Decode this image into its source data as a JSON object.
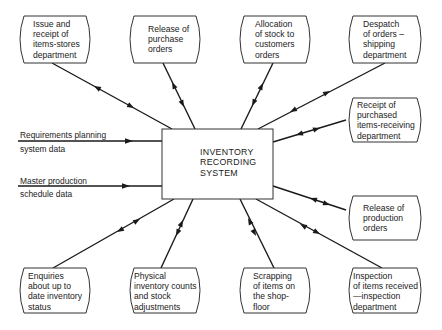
{
  "center": {
    "id": "inventory-recording-system",
    "label": "INVENTORY\nRECORDING\nSYSTEM"
  },
  "nodes": [
    {
      "id": "issue-receipt",
      "label": "Issue and\nreceipt of\nitems-stores\ndepartment",
      "position": "top-1"
    },
    {
      "id": "release-purchase",
      "label": "Release of\npurchase\norders",
      "position": "top-2"
    },
    {
      "id": "allocation-stock",
      "label": "Allocation\nof stock to\ncustomers\norders",
      "position": "top-3"
    },
    {
      "id": "despatch-orders",
      "label": "Despatch\nof orders –\nshipping\ndepartment",
      "position": "top-4"
    },
    {
      "id": "receipt-purchased",
      "label": "Receipt of\npurchased\nitems-receiving\ndepartment",
      "position": "right-1"
    },
    {
      "id": "release-production",
      "label": "Release of\nproduction\norders",
      "position": "right-2"
    },
    {
      "id": "enquiries",
      "label": "Enquiries\nabout up to\ndate inventory\nstatus",
      "position": "bottom-1"
    },
    {
      "id": "physical-counts",
      "label": "Physical\ninventory counts\nand stock\nadjustments",
      "position": "bottom-2"
    },
    {
      "id": "scrapping",
      "label": "Scrapping\nof items on\nthe shop-\nfloor",
      "position": "bottom-3"
    },
    {
      "id": "inspection",
      "label": "Inspection\nof items received\n—inspection\ndepartment",
      "position": "bottom-4"
    }
  ],
  "inputs": [
    {
      "id": "requirements-planning",
      "line1": "Requirements planning",
      "line2": "system data",
      "direction": "into-center"
    },
    {
      "id": "master-production",
      "line1": "Master production",
      "line2": "schedule data",
      "direction": "into-center"
    }
  ],
  "edges": [
    {
      "from": "issue-receipt",
      "to": "inventory-recording-system",
      "arrows": "bidirectional"
    },
    {
      "from": "release-purchase",
      "to": "inventory-recording-system",
      "arrows": "bidirectional"
    },
    {
      "from": "allocation-stock",
      "to": "inventory-recording-system",
      "arrows": "bidirectional"
    },
    {
      "from": "despatch-orders",
      "to": "inventory-recording-system",
      "arrows": "bidirectional"
    },
    {
      "from": "receipt-purchased",
      "to": "inventory-recording-system",
      "arrows": "bidirectional"
    },
    {
      "from": "release-production",
      "to": "inventory-recording-system",
      "arrows": "bidirectional"
    },
    {
      "from": "enquiries",
      "to": "inventory-recording-system",
      "arrows": "bidirectional"
    },
    {
      "from": "physical-counts",
      "to": "inventory-recording-system",
      "arrows": "bidirectional"
    },
    {
      "from": "scrapping",
      "to": "inventory-recording-system",
      "arrows": "bidirectional"
    },
    {
      "from": "inspection",
      "to": "inventory-recording-system",
      "arrows": "bidirectional"
    }
  ],
  "colors": {
    "line": "#1a1a1a",
    "box_stroke": "#333333",
    "background": "#ffffff"
  }
}
